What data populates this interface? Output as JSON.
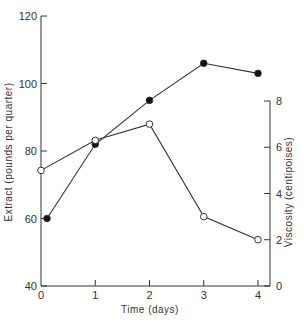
{
  "chart_data": {
    "type": "line",
    "title": "",
    "xlabel": "Time (days)",
    "ylabel": "Extract (pounds per quarter)",
    "y2label": "Viscosity (centipoises)",
    "x": [
      0,
      1,
      2,
      3,
      4
    ],
    "xticks": [
      "0",
      "1",
      "2",
      "3",
      "4"
    ],
    "ylim": [
      40,
      120
    ],
    "yticks": [
      "40",
      "60",
      "80",
      "100",
      "120"
    ],
    "y2lim": [
      0,
      8
    ],
    "y2ticks": [
      "0",
      "2",
      "4",
      "6",
      "8"
    ],
    "grid": false,
    "series": [
      {
        "name": "Extract",
        "axis": "left",
        "marker": "filled-circle",
        "values": [
          60,
          82,
          95,
          106,
          103
        ]
      },
      {
        "name": "Viscosity",
        "axis": "right",
        "marker": "open-circle",
        "values": [
          5.0,
          6.3,
          7.0,
          3.0,
          2.0
        ]
      }
    ]
  }
}
